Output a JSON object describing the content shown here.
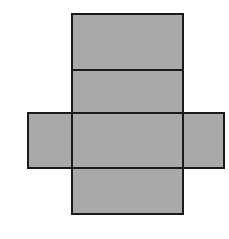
{
  "figure": {
    "label": "A",
    "caption_text": "A",
    "kind": "geometric-net"
  },
  "canvas": {
    "width": 229,
    "height": 239,
    "background_color": "#FFFFFF"
  },
  "style": {
    "fill_color": "#A9A9A9",
    "stroke_color": "#1A1A1A",
    "stroke_width": 2,
    "label_color": "#2B2B2B"
  },
  "chart_data": {
    "type": "diagram",
    "title": "A",
    "subtitle": "",
    "xlabel": "",
    "ylabel": "",
    "grid": false,
    "legend_position": "none",
    "xlim": [
      0,
      229
    ],
    "ylim": [
      0,
      239
    ],
    "shape_kind": "net-of-rectangular-box",
    "panel_count": 6,
    "panels": [
      {
        "name": "top-panel",
        "role": "vertical-strip-1",
        "x": 72,
        "y": 14,
        "width": 111,
        "height": 56
      },
      {
        "name": "upper-middle-panel",
        "role": "vertical-strip-2",
        "x": 72,
        "y": 70,
        "width": 111,
        "height": 43
      },
      {
        "name": "center-panel",
        "role": "vertical-strip-3",
        "x": 72,
        "y": 113,
        "width": 111,
        "height": 55
      },
      {
        "name": "bottom-panel",
        "role": "vertical-strip-4",
        "x": 72,
        "y": 168,
        "width": 111,
        "height": 46
      },
      {
        "name": "left-flap-panel",
        "role": "horizontal-band-left",
        "x": 28,
        "y": 113,
        "width": 44,
        "height": 55
      },
      {
        "name": "right-flap-panel",
        "role": "horizontal-band-right",
        "x": 183,
        "y": 113,
        "width": 41,
        "height": 55
      }
    ],
    "outlines": [
      {
        "name": "vertical-strip-outline",
        "x": 72,
        "y": 14,
        "width": 111,
        "height": 200
      },
      {
        "name": "horizontal-band-outline",
        "x": 28,
        "y": 113,
        "width": 196,
        "height": 55
      }
    ],
    "dividers": [
      {
        "name": "divider-top",
        "orientation": "horizontal",
        "x1": 72,
        "y1": 70,
        "x2": 183,
        "y2": 70
      },
      {
        "name": "divider-middle",
        "orientation": "horizontal",
        "x1": 72,
        "y1": 113,
        "x2": 183,
        "y2": 113
      },
      {
        "name": "divider-bottom",
        "orientation": "horizontal",
        "x1": 72,
        "y1": 168,
        "x2": 183,
        "y2": 168
      },
      {
        "name": "divider-left-fold",
        "orientation": "vertical",
        "x1": 72,
        "y1": 113,
        "x2": 72,
        "y2": 168
      },
      {
        "name": "divider-right-fold",
        "orientation": "vertical",
        "x1": 183,
        "y1": 113,
        "x2": 183,
        "y2": 168
      }
    ]
  }
}
